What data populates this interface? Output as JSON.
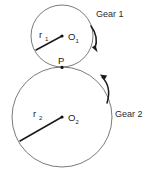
{
  "figure": {
    "background_color": "#ffffff",
    "stroke_color": "#6b6b6b",
    "line_color": "#1a1a1a"
  },
  "labels": {
    "gear1": "Gear 1",
    "gear2": "Gear 2",
    "radius1_base": "r",
    "radius1_sub": "1",
    "radius2_base": "r",
    "radius2_sub": "2",
    "center1_base": "O",
    "center1_sub": "1",
    "center2_base": "O",
    "center2_sub": "2",
    "contact_point": "P"
  },
  "geometry": {
    "circle1": {
      "cx": 62,
      "cy": 36,
      "r": 31
    },
    "circle2": {
      "cx": 62,
      "cy": 117,
      "r": 50
    },
    "contact": {
      "x": 62,
      "y": 67
    },
    "radius1_end": {
      "x": 36,
      "y": 50
    },
    "radius2_end": {
      "x": 20,
      "y": 141
    }
  },
  "annotations": {
    "gear1_rotation": "clockwise",
    "gear2_rotation": "counter-clockwise"
  }
}
